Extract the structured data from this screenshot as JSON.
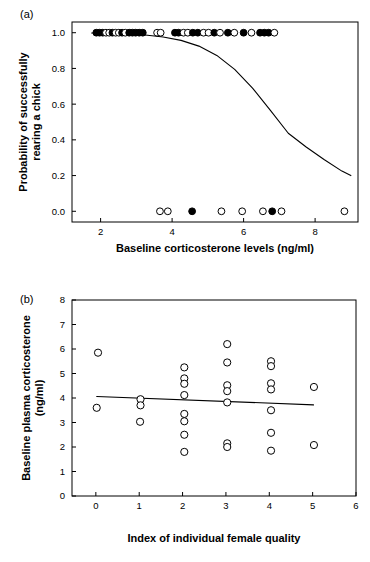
{
  "figure": {
    "panel_a_label": "(a)",
    "panel_b_label": "(b)"
  },
  "chart_data": [
    {
      "id": "panel_a",
      "type": "scatter",
      "title": "",
      "xlabel": "Baseline corticosterone levels (ng/ml)",
      "ylabel": "Probability of successfully rearing a chick",
      "ylabel_line1": "Probability of successfully",
      "ylabel_line2": "rearing a chick",
      "xlim": [
        1.2,
        9.2
      ],
      "ylim": [
        -0.06,
        1.06
      ],
      "xticks": [
        2,
        4,
        6,
        8
      ],
      "xtick_labels": [
        "2",
        "4",
        "6",
        "8"
      ],
      "yticks": [
        0.0,
        0.2,
        0.4,
        0.6,
        0.8,
        1.0
      ],
      "ytick_labels": [
        "0.0",
        "0.2",
        "0.4",
        "0.6",
        "0.8",
        "1.0"
      ],
      "grid": false,
      "legend": "none",
      "marker_size": 3.4,
      "series": [
        {
          "name": "Successful (value 1)",
          "y_value": 1.0,
          "points": [
            {
              "x": 1.88,
              "fill": "filled"
            },
            {
              "x": 1.97,
              "fill": "filled"
            },
            {
              "x": 2.06,
              "fill": "filled"
            },
            {
              "x": 2.15,
              "fill": "open"
            },
            {
              "x": 2.24,
              "fill": "open"
            },
            {
              "x": 2.33,
              "fill": "filled"
            },
            {
              "x": 2.42,
              "fill": "open"
            },
            {
              "x": 2.51,
              "fill": "open"
            },
            {
              "x": 2.6,
              "fill": "filled"
            },
            {
              "x": 2.69,
              "fill": "open"
            },
            {
              "x": 2.8,
              "fill": "filled"
            },
            {
              "x": 2.89,
              "fill": "filled"
            },
            {
              "x": 2.98,
              "fill": "filled"
            },
            {
              "x": 3.08,
              "fill": "filled"
            },
            {
              "x": 3.18,
              "fill": "filled"
            },
            {
              "x": 3.58,
              "fill": "open"
            },
            {
              "x": 3.68,
              "fill": "open"
            },
            {
              "x": 4.08,
              "fill": "filled"
            },
            {
              "x": 4.18,
              "fill": "filled"
            },
            {
              "x": 4.32,
              "fill": "open"
            },
            {
              "x": 4.44,
              "fill": "open"
            },
            {
              "x": 4.58,
              "fill": "filled"
            },
            {
              "x": 4.72,
              "fill": "filled"
            },
            {
              "x": 4.88,
              "fill": "open"
            },
            {
              "x": 5.02,
              "fill": "open"
            },
            {
              "x": 5.18,
              "fill": "filled"
            },
            {
              "x": 5.34,
              "fill": "open"
            },
            {
              "x": 5.56,
              "fill": "filled"
            },
            {
              "x": 5.74,
              "fill": "open"
            },
            {
              "x": 6.0,
              "fill": "filled"
            },
            {
              "x": 6.22,
              "fill": "open"
            },
            {
              "x": 6.46,
              "fill": "filled"
            },
            {
              "x": 6.58,
              "fill": "filled"
            },
            {
              "x": 6.7,
              "fill": "filled"
            },
            {
              "x": 6.86,
              "fill": "open"
            }
          ]
        },
        {
          "name": "Failed (value 0)",
          "y_value": 0.0,
          "points": [
            {
              "x": 3.66,
              "fill": "open"
            },
            {
              "x": 3.88,
              "fill": "open"
            },
            {
              "x": 4.56,
              "fill": "filled"
            },
            {
              "x": 5.38,
              "fill": "open"
            },
            {
              "x": 5.96,
              "fill": "open"
            },
            {
              "x": 6.54,
              "fill": "open"
            },
            {
              "x": 6.8,
              "fill": "filled"
            },
            {
              "x": 7.06,
              "fill": "open"
            },
            {
              "x": 8.82,
              "fill": "open"
            }
          ]
        }
      ],
      "fit_curve": {
        "name": "Logistic fit",
        "x": [
          1.75,
          2.25,
          2.75,
          3.25,
          3.75,
          4.25,
          4.75,
          5.25,
          5.75,
          6.25,
          6.75,
          7.25,
          7.75,
          8.25,
          8.75,
          9.0
        ],
        "y": [
          0.998,
          0.996,
          0.993,
          0.987,
          0.976,
          0.957,
          0.925,
          0.873,
          0.795,
          0.69,
          0.565,
          0.437,
          0.36,
          0.29,
          0.225,
          0.2
        ]
      }
    },
    {
      "id": "panel_b",
      "type": "scatter",
      "title": "",
      "xlabel": "Index of individual female quality",
      "ylabel": "Baseline plasma corticosterone (ng/ml)",
      "ylabel_line1": "Baseline plasma corticosterone",
      "ylabel_line2": "(ng/ml)",
      "xlim": [
        -0.55,
        6.0
      ],
      "ylim": [
        0,
        8
      ],
      "xticks": [
        0,
        1,
        2,
        3,
        4,
        5,
        6
      ],
      "xtick_labels": [
        "0",
        "1",
        "2",
        "3",
        "4",
        "5",
        "6"
      ],
      "yticks": [
        0,
        1,
        2,
        3,
        4,
        5,
        6,
        7,
        8
      ],
      "ytick_labels": [
        "0",
        "1",
        "2",
        "3",
        "4",
        "5",
        "6",
        "7",
        "8"
      ],
      "grid": false,
      "legend": "none",
      "marker_size": 3.6,
      "points": [
        {
          "x": 0.05,
          "y": 5.85,
          "fill": "open"
        },
        {
          "x": 0.02,
          "y": 3.6,
          "fill": "open"
        },
        {
          "x": 1.03,
          "y": 3.95,
          "fill": "open"
        },
        {
          "x": 1.03,
          "y": 3.7,
          "fill": "open"
        },
        {
          "x": 1.02,
          "y": 3.03,
          "fill": "open"
        },
        {
          "x": 2.04,
          "y": 5.25,
          "fill": "open"
        },
        {
          "x": 2.04,
          "y": 4.8,
          "fill": "open"
        },
        {
          "x": 2.04,
          "y": 4.58,
          "fill": "open"
        },
        {
          "x": 2.04,
          "y": 4.12,
          "fill": "open"
        },
        {
          "x": 2.04,
          "y": 3.35,
          "fill": "open"
        },
        {
          "x": 2.04,
          "y": 3.05,
          "fill": "open"
        },
        {
          "x": 2.04,
          "y": 2.5,
          "fill": "open"
        },
        {
          "x": 2.04,
          "y": 1.8,
          "fill": "open"
        },
        {
          "x": 3.03,
          "y": 6.2,
          "fill": "open"
        },
        {
          "x": 3.03,
          "y": 5.45,
          "fill": "open"
        },
        {
          "x": 3.03,
          "y": 4.52,
          "fill": "open"
        },
        {
          "x": 3.03,
          "y": 4.28,
          "fill": "open"
        },
        {
          "x": 3.03,
          "y": 3.82,
          "fill": "open"
        },
        {
          "x": 3.03,
          "y": 2.15,
          "fill": "open"
        },
        {
          "x": 3.03,
          "y": 2.0,
          "fill": "open"
        },
        {
          "x": 4.04,
          "y": 5.5,
          "fill": "open"
        },
        {
          "x": 4.04,
          "y": 5.3,
          "fill": "open"
        },
        {
          "x": 4.04,
          "y": 4.6,
          "fill": "open"
        },
        {
          "x": 4.04,
          "y": 4.35,
          "fill": "open"
        },
        {
          "x": 4.04,
          "y": 3.5,
          "fill": "open"
        },
        {
          "x": 4.04,
          "y": 2.58,
          "fill": "open"
        },
        {
          "x": 4.04,
          "y": 1.85,
          "fill": "open"
        },
        {
          "x": 5.03,
          "y": 4.45,
          "fill": "open"
        },
        {
          "x": 5.03,
          "y": 2.08,
          "fill": "open"
        }
      ],
      "fit_line": {
        "name": "Linear regression",
        "x": [
          0.02,
          5.02
        ],
        "y": [
          4.06,
          3.72
        ]
      }
    }
  ]
}
